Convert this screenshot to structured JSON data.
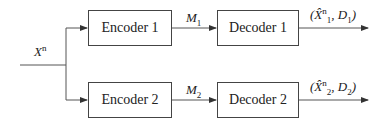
{
  "diagram": {
    "input_label": "X",
    "input_sup": "n",
    "encoders": [
      {
        "label": "Encoder 1"
      },
      {
        "label": "Encoder 2"
      }
    ],
    "messages": [
      {
        "label": "M",
        "sub": "1"
      },
      {
        "label": "M",
        "sub": "2"
      }
    ],
    "decoders": [
      {
        "label": "Decoder 1"
      },
      {
        "label": "Decoder 2"
      }
    ],
    "outputs": [
      {
        "open": "(",
        "xhat": "X̂",
        "sup": "n",
        "sub": "1",
        "mid": ", D",
        "dsub": "1",
        "close": ")"
      },
      {
        "open": "(",
        "xhat": "X̂",
        "sup": "n",
        "sub": "2",
        "mid": ", D",
        "dsub": "2",
        "close": ")"
      }
    ]
  }
}
